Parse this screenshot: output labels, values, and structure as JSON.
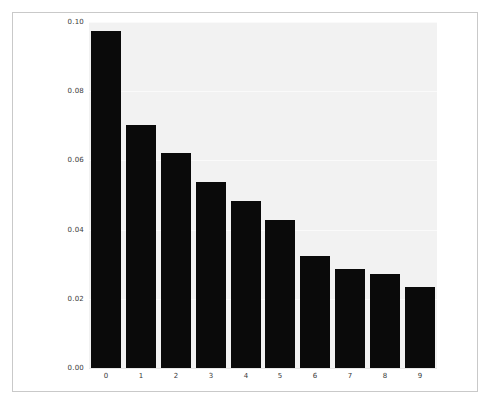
{
  "figure": {
    "background_color": "#ffffff",
    "frame_color": "#c9c9c9",
    "plot_background_color": "#f2f2f2",
    "bar_color": "#0a0a0a",
    "gridline_color": "#fafafa",
    "tick_label_color": "#3a3a3a"
  },
  "chart_data": {
    "type": "bar",
    "title": "",
    "xlabel": "",
    "ylabel": "",
    "categories": [
      "0",
      "1",
      "2",
      "3",
      "4",
      "5",
      "6",
      "7",
      "8",
      "9"
    ],
    "values": [
      0.0975,
      0.0703,
      0.062,
      0.0537,
      0.0483,
      0.0428,
      0.0323,
      0.0285,
      0.0273,
      0.0235
    ],
    "ylim": [
      0.0,
      0.1
    ],
    "xlim": [
      -0.5,
      9.5
    ],
    "yticks": [
      0.0,
      0.02,
      0.04,
      0.06,
      0.08,
      0.1
    ],
    "ytick_labels": [
      "0.00",
      "0.02",
      "0.04",
      "0.06",
      "0.08",
      "0.10"
    ],
    "xtick_labels": [
      "0",
      "1",
      "2",
      "3",
      "4",
      "5",
      "6",
      "7",
      "8",
      "9"
    ],
    "grid": true,
    "grid_axis": "y",
    "legend": false,
    "legend_position": "none",
    "series": [
      {
        "name": "",
        "values": [
          0.0975,
          0.0703,
          0.062,
          0.0537,
          0.0483,
          0.0428,
          0.0323,
          0.0285,
          0.0273,
          0.0235
        ]
      }
    ]
  }
}
